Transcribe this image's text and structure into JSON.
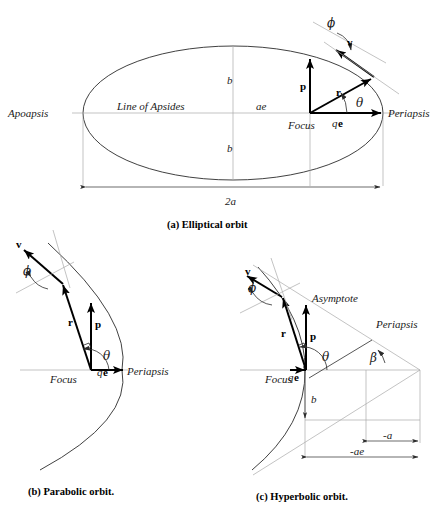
{
  "figure": {
    "title_bottom": "",
    "panels": [
      {
        "id": "elliptical",
        "caption": "(a) Elliptical orbit",
        "labels": {
          "apoapsis": "Apoapsis",
          "periapsis": "Periapsis",
          "line_of_apsides": "Line of Apsides",
          "focus": "Focus",
          "semi_minor_top": "b",
          "semi_minor_bottom": "b",
          "focal_distance": "ae",
          "major_axis": "2a",
          "periapsis_radius": "q",
          "ecc_vector": "e",
          "vector_p": "p",
          "vector_r": "r",
          "vector_v": "v",
          "angle_theta": "θ",
          "angle_phi": "ϕ"
        }
      },
      {
        "id": "parabolic",
        "caption": "(b) Parabolic orbit.",
        "labels": {
          "periapsis": "Periapsis",
          "focus": "Focus",
          "periapsis_radius": "q",
          "ecc_vector": "e",
          "vector_p": "p",
          "vector_r": "r",
          "vector_v": "v",
          "angle_theta": "θ",
          "angle_phi": "ϕ"
        }
      },
      {
        "id": "hyperbolic",
        "caption": "(c) Hyperbolic orbit.",
        "labels": {
          "periapsis": "Periapsis",
          "focus": "Focus",
          "asymptote": "Asymptote",
          "periapsis_radius": "q",
          "ecc_vector": "e",
          "vector_p": "p",
          "vector_r": "r",
          "vector_v": "v",
          "angle_theta": "θ",
          "angle_phi": "ϕ",
          "angle_beta": "β",
          "semi_minor": "b",
          "neg_a": "-a",
          "neg_ae": "-ae"
        }
      }
    ],
    "colors": {
      "curve": "#2b2b2b",
      "auxiliary": "#a9a9a9",
      "vector": "#000000",
      "text": "#1a1a1a",
      "background": "#ffffff"
    }
  }
}
